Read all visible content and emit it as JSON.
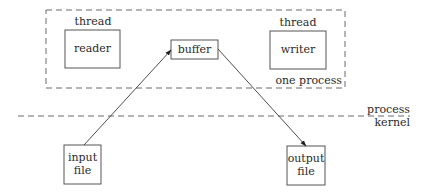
{
  "diagram": {
    "process_boundary": {
      "label": "one process"
    },
    "threads": [
      {
        "heading": "thread",
        "name": "reader"
      },
      {
        "heading": "thread",
        "name": "writer"
      }
    ],
    "buffer": {
      "name": "buffer"
    },
    "files": [
      {
        "line1": "input",
        "line2": "file"
      },
      {
        "line1": "output",
        "line2": "file"
      }
    ],
    "separator": {
      "upper_label": "process",
      "lower_label": "kernel"
    },
    "edges": [
      {
        "from": "input file",
        "to": "buffer"
      },
      {
        "from": "buffer",
        "to": "output file"
      }
    ]
  }
}
